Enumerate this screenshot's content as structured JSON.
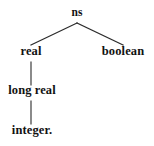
{
  "figure": {
    "kind": "tree-diagram",
    "background_color": "#ffffff",
    "line_color": "#2b2b2b",
    "text_color": "#121212"
  },
  "nodes": [
    {
      "id": "ns",
      "label": "ns",
      "level": 0,
      "x": 77,
      "y": 18,
      "role": "root"
    },
    {
      "id": "real",
      "label": "real",
      "level": 1,
      "x": 31,
      "y": 57,
      "role": "branch"
    },
    {
      "id": "boolean",
      "label": "boolean",
      "level": 1,
      "x": 123,
      "y": 57,
      "role": "branch"
    },
    {
      "id": "long-real",
      "label": "long real",
      "level": 2,
      "x": 32,
      "y": 96,
      "role": "branch"
    },
    {
      "id": "integer",
      "label": "integer.",
      "level": 3,
      "x": 32,
      "y": 136,
      "role": "leaf"
    }
  ],
  "edges": [
    {
      "id": "ns-real",
      "from": "ns",
      "to": "real",
      "x1": 77,
      "y1": 23,
      "x2": 31,
      "y2": 45,
      "style": "diagonal"
    },
    {
      "id": "ns-boolean",
      "from": "ns",
      "to": "boolean",
      "x1": 77,
      "y1": 23,
      "x2": 123,
      "y2": 45,
      "style": "diagonal"
    },
    {
      "id": "real-long-real",
      "from": "real",
      "to": "long real",
      "x1": 31,
      "y1": 62,
      "x2": 31,
      "y2": 85,
      "style": "vertical"
    },
    {
      "id": "long-real-integer",
      "from": "long real",
      "to": "integer.",
      "x1": 31,
      "y1": 101,
      "x2": 31,
      "y2": 124,
      "style": "vertical"
    }
  ]
}
